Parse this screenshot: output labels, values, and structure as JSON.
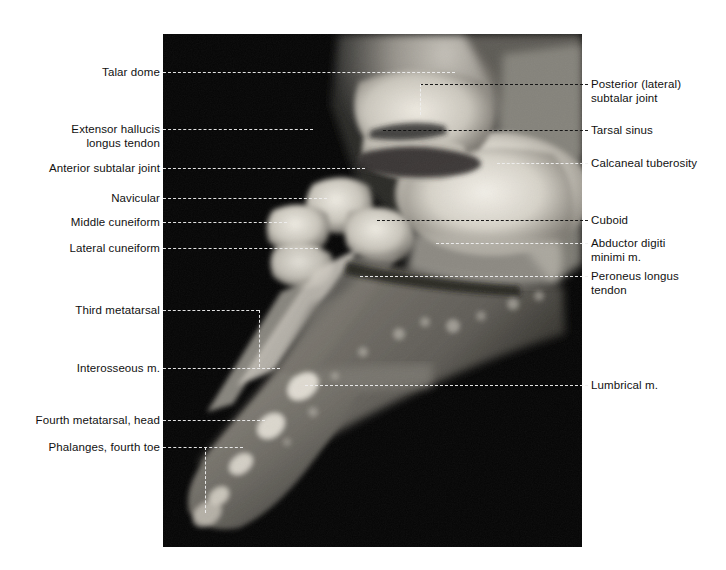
{
  "figure": {
    "modality": "MRI",
    "view": "sagittal foot",
    "plate": {
      "x": 163,
      "y": 34,
      "width": 419,
      "height": 513,
      "background_color": "#040404"
    },
    "colors": {
      "page_background": "#ffffff",
      "label_text": "#111111",
      "leader_light": "#efefef",
      "leader_dark": "#111111",
      "bone_bright": "#e8e6e0",
      "soft_tissue": "#8e8c86",
      "marrow": "#d8d4cb"
    }
  },
  "labels_left": [
    {
      "id": "talar-dome",
      "text": "Talar dome",
      "text_x": 160,
      "text_y": 72,
      "leader": {
        "x1": 163,
        "x2": 455,
        "y": 72,
        "tone": "light"
      }
    },
    {
      "id": "extensor-hallucis-longus-tendon",
      "text": "Extensor hallucis\nlongus tendon",
      "text_x": 160,
      "text_y": 136,
      "leader": {
        "x1": 163,
        "x2": 313,
        "y": 129,
        "tone": "light"
      }
    },
    {
      "id": "anterior-subtalar-joint",
      "text": "Anterior subtalar joint",
      "text_x": 160,
      "text_y": 168,
      "leader": {
        "x1": 163,
        "x2": 365,
        "y": 168,
        "tone": "light"
      }
    },
    {
      "id": "navicular",
      "text": "Navicular",
      "text_x": 160,
      "text_y": 198,
      "leader": {
        "x1": 163,
        "x2": 327,
        "y": 198,
        "tone": "light"
      }
    },
    {
      "id": "middle-cuneiform",
      "text": "Middle cuneiform",
      "text_x": 160,
      "text_y": 222,
      "leader": {
        "x1": 163,
        "x2": 287,
        "y": 222,
        "tone": "light"
      }
    },
    {
      "id": "lateral-cuneiform",
      "text": "Lateral cuneiform",
      "text_x": 160,
      "text_y": 248,
      "leader": {
        "x1": 163,
        "x2": 318,
        "y": 248,
        "tone": "light"
      }
    },
    {
      "id": "third-metatarsal",
      "text": "Third metatarsal",
      "text_x": 160,
      "text_y": 310,
      "leader": {
        "x1": 163,
        "x2": 259,
        "y": 310,
        "tone": "light"
      },
      "leader_vertical": {
        "x": 259,
        "y1": 310,
        "y2": 367,
        "tone": "light"
      }
    },
    {
      "id": "interosseous-m",
      "text": "Interosseous m.",
      "text_x": 160,
      "text_y": 368,
      "leader": {
        "x1": 163,
        "x2": 280,
        "y": 368,
        "tone": "light"
      }
    },
    {
      "id": "fourth-metatarsal-head",
      "text": "Fourth metatarsal, head",
      "text_x": 160,
      "text_y": 420,
      "leader": {
        "x1": 163,
        "x2": 265,
        "y": 420,
        "tone": "light"
      }
    },
    {
      "id": "phalanges-fourth-toe",
      "text": "Phalanges, fourth toe",
      "text_x": 160,
      "text_y": 447,
      "leader": {
        "x1": 163,
        "x2": 243,
        "y": 447,
        "tone": "light"
      },
      "leader_vertical": {
        "x": 205,
        "y1": 447,
        "y2": 513,
        "tone": "light"
      }
    }
  ],
  "labels_right": [
    {
      "id": "posterior-lateral-subtalar-joint",
      "text": "Posterior (lateral)\nsubtalar joint",
      "text_x": 591,
      "text_y": 91,
      "leader": {
        "x1": 420,
        "x2": 588,
        "y": 84,
        "tone": "dark"
      },
      "leader_vertical": {
        "x": 420,
        "y1": 84,
        "y2": 115,
        "tone": "light"
      }
    },
    {
      "id": "tarsal-sinus",
      "text": "Tarsal sinus",
      "text_x": 591,
      "text_y": 130,
      "leader": {
        "x1": 383,
        "x2": 588,
        "y": 130,
        "tone": "dark"
      }
    },
    {
      "id": "calcaneal-tuberosity",
      "text": "Calcaneal tuberosity",
      "text_x": 591,
      "text_y": 163,
      "leader": {
        "x1": 497,
        "x2": 588,
        "y": 163,
        "tone": "light"
      }
    },
    {
      "id": "cuboid",
      "text": "Cuboid",
      "text_x": 591,
      "text_y": 220,
      "leader": {
        "x1": 377,
        "x2": 588,
        "y": 220,
        "tone": "dark"
      }
    },
    {
      "id": "abductor-digiti-minimi-m",
      "text": "Abductor digiti\nminimi m.",
      "text_x": 591,
      "text_y": 250,
      "leader": {
        "x1": 436,
        "x2": 588,
        "y": 243,
        "tone": "light"
      }
    },
    {
      "id": "peroneus-longus-tendon",
      "text": "Peroneus longus\ntendon",
      "text_x": 591,
      "text_y": 283,
      "leader": {
        "x1": 360,
        "x2": 588,
        "y": 276,
        "tone": "light"
      }
    },
    {
      "id": "lumbrical-m",
      "text": "Lumbrical m.",
      "text_x": 591,
      "text_y": 385,
      "leader": {
        "x1": 305,
        "x2": 588,
        "y": 385,
        "tone": "light"
      }
    }
  ]
}
